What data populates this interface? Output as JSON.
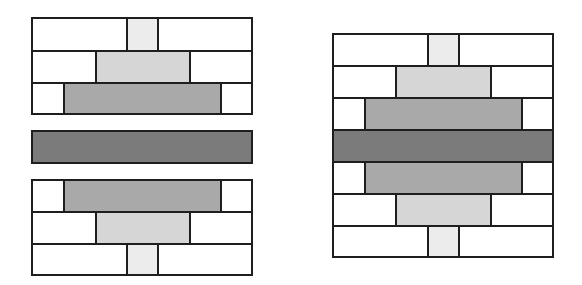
{
  "diagram": {
    "colors": {
      "white": "#ffffff",
      "lightest": "#ececec",
      "light": "#d6d6d6",
      "medium": "#a9a9a9",
      "dark": "#7b7b7b",
      "border": "#1e1e1e"
    },
    "left_group": {
      "top_block": {
        "rows": [
          {
            "cells": [
              {
                "fill": "white"
              },
              {
                "fill": "lightest"
              },
              {
                "fill": "white"
              }
            ]
          },
          {
            "cells": [
              {
                "fill": "white"
              },
              {
                "fill": "light"
              },
              {
                "fill": "white"
              }
            ]
          },
          {
            "cells": [
              {
                "fill": "white"
              },
              {
                "fill": "medium"
              },
              {
                "fill": "white"
              }
            ]
          }
        ]
      },
      "middle_bar": {
        "fill": "dark"
      },
      "bottom_block": {
        "rows": [
          {
            "cells": [
              {
                "fill": "white"
              },
              {
                "fill": "medium"
              },
              {
                "fill": "white"
              }
            ]
          },
          {
            "cells": [
              {
                "fill": "white"
              },
              {
                "fill": "light"
              },
              {
                "fill": "white"
              }
            ]
          },
          {
            "cells": [
              {
                "fill": "white"
              },
              {
                "fill": "lightest"
              },
              {
                "fill": "white"
              }
            ]
          }
        ]
      }
    },
    "right_group": {
      "assembled_block": {
        "rows": [
          {
            "cells": [
              {
                "fill": "white"
              },
              {
                "fill": "lightest"
              },
              {
                "fill": "white"
              }
            ]
          },
          {
            "cells": [
              {
                "fill": "white"
              },
              {
                "fill": "light"
              },
              {
                "fill": "white"
              }
            ]
          },
          {
            "cells": [
              {
                "fill": "white"
              },
              {
                "fill": "medium"
              },
              {
                "fill": "white"
              }
            ]
          },
          {
            "cells": [
              {
                "fill": "dark"
              }
            ]
          },
          {
            "cells": [
              {
                "fill": "white"
              },
              {
                "fill": "medium"
              },
              {
                "fill": "white"
              }
            ]
          },
          {
            "cells": [
              {
                "fill": "white"
              },
              {
                "fill": "light"
              },
              {
                "fill": "white"
              }
            ]
          },
          {
            "cells": [
              {
                "fill": "white"
              },
              {
                "fill": "lightest"
              },
              {
                "fill": "white"
              }
            ]
          }
        ]
      }
    }
  }
}
